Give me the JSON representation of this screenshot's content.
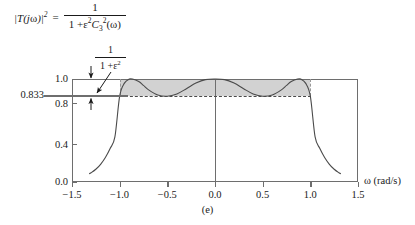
{
  "formula": {
    "lhs": "|T(",
    "lhs_j": "j",
    "lhs_omega": "ω",
    "lhs_close": ")|",
    "lhs_exp": "2",
    "equals": "=",
    "numerator": "1",
    "den_one": "1 +",
    "den_eps": "ε",
    "den_eps_exp": "2",
    "den_c": "C",
    "den_c_sub": "3",
    "den_c_exp": "2",
    "den_arg": "(ω)"
  },
  "annotation": {
    "numerator": "1",
    "den_one": "1 +",
    "den_eps": "ε",
    "den_eps_exp": "2"
  },
  "axes": {
    "y_label_833": "0.833",
    "y_ticks": [
      {
        "label": "1.0",
        "value": 1.0
      },
      {
        "label": "0.8",
        "value": 0.8
      },
      {
        "label": "0.4",
        "value": 0.4
      },
      {
        "label": "0.0",
        "value": 0.0
      }
    ],
    "x_ticks": [
      {
        "label": "−1.5",
        "value": -1.5
      },
      {
        "label": "−1.0",
        "value": -1.0
      },
      {
        "label": "−0.5",
        "value": -0.5
      },
      {
        "label": "0.0",
        "value": 0.0
      },
      {
        "label": "0.5",
        "value": 0.5
      },
      {
        "label": "1.0",
        "value": 1.0
      },
      {
        "label": "1.5",
        "value": 1.5
      }
    ],
    "x_title": "ω (rad/s)"
  },
  "caption": "(e)",
  "colors": {
    "band_fill": "#d2d2d2",
    "axis": "#6e6e6e",
    "curve": "#4a4a4a",
    "dash": "#4a4a4a",
    "text": "#1a1a1a"
  },
  "chart_data": {
    "type": "line",
    "title": "",
    "xlabel": "ω (rad/s)",
    "ylabel": "|T(jω)|^2",
    "xlim": [
      -1.5,
      1.5
    ],
    "ylim": [
      0.0,
      1.0
    ],
    "xticks": [
      -1.5,
      -1.0,
      -0.5,
      0.0,
      0.5,
      1.0,
      1.5
    ],
    "yticks": [
      0.0,
      0.4,
      0.8,
      1.0
    ],
    "grid": false,
    "legend": null,
    "ripple_min": 0.833,
    "ripple_max": 1.0,
    "passband_edges": [
      -1.0,
      1.0
    ],
    "order": 3,
    "epsilon_squared": 0.2,
    "annotations": [
      {
        "text": "1/(1+ε²)",
        "points_to": "ripple band between 1.0 and 0.833"
      },
      {
        "text": "0.833",
        "points_to": "ripple minimum level"
      }
    ],
    "series": [
      {
        "name": "|T(jω)|^2 = 1/(1+ε²C₃²(ω))",
        "x": [
          -1.32,
          -1.3,
          -1.25,
          -1.2,
          -1.15,
          -1.1,
          -1.05,
          -1.0,
          -0.95,
          -0.9,
          -0.866,
          -0.8,
          -0.75,
          -0.7,
          -0.6,
          -0.5,
          -0.4,
          -0.3,
          -0.2,
          -0.1,
          0.0,
          0.1,
          0.2,
          0.3,
          0.4,
          0.5,
          0.6,
          0.7,
          0.75,
          0.8,
          0.866,
          0.9,
          0.95,
          1.0,
          1.05,
          1.1,
          1.15,
          1.2,
          1.25,
          1.3,
          1.32
        ],
        "y": [
          0.08,
          0.09,
          0.124,
          0.172,
          0.238,
          0.325,
          0.438,
          0.833,
          0.96,
          0.999,
          1.0,
          0.975,
          0.938,
          0.897,
          0.845,
          0.833,
          0.855,
          0.906,
          0.96,
          0.994,
          1.0,
          0.994,
          0.96,
          0.906,
          0.855,
          0.833,
          0.845,
          0.897,
          0.938,
          0.975,
          1.0,
          0.999,
          0.96,
          0.833,
          0.438,
          0.325,
          0.238,
          0.172,
          0.124,
          0.09,
          0.08
        ]
      }
    ]
  }
}
